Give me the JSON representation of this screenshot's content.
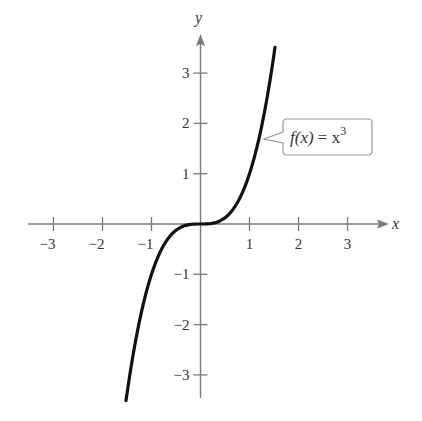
{
  "chart_data": {
    "type": "line",
    "title": "",
    "xlabel": "x",
    "ylabel": "y",
    "xlim": [
      -3.5,
      3.8
    ],
    "ylim": [
      -3.5,
      3.8
    ],
    "grid": false,
    "x_ticks": [
      -3,
      -2,
      -1,
      1,
      2,
      3
    ],
    "y_ticks": [
      -3,
      -2,
      -1,
      1,
      2,
      3
    ],
    "x_tick_labels": [
      "−3",
      "−2",
      "−1",
      "1",
      "2",
      "3"
    ],
    "y_tick_labels": [
      "−3",
      "−2",
      "−1",
      "1",
      "2",
      "3"
    ],
    "series": [
      {
        "name": "f(x) = x^3",
        "function": "x^3",
        "domain": [
          -1.52,
          1.52
        ],
        "x": [
          -1.5,
          -1.25,
          -1,
          -0.75,
          -0.5,
          -0.25,
          0,
          0.25,
          0.5,
          0.75,
          1,
          1.25,
          1.5
        ],
        "y": [
          -3.375,
          -1.953,
          -1,
          -0.422,
          -0.125,
          -0.016,
          0,
          0.016,
          0.125,
          0.422,
          1,
          1.953,
          3.375
        ]
      }
    ],
    "annotations": [
      {
        "text": "f(x) = x^3",
        "type": "callout",
        "points_to": [
          1.35,
          2.46
        ]
      }
    ]
  },
  "labels": {
    "x_axis": "x",
    "y_axis": "y",
    "callout": {
      "fx": "f(x)",
      "eq": " = x",
      "exp": "3"
    }
  },
  "colors": {
    "axis": "#7a7a7a",
    "curve": "#111111",
    "text": "#333333",
    "callout_border": "#999999"
  }
}
